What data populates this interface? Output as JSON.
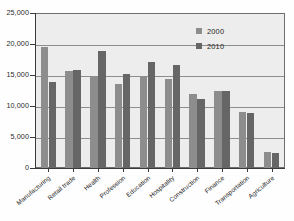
{
  "chart_data": {
    "type": "bar",
    "title": "",
    "xlabel": "",
    "ylabel": "",
    "ylim": [
      0,
      25000
    ],
    "ytick_values": [
      0,
      5000,
      10000,
      15000,
      20000,
      25000
    ],
    "ytick_labels": [
      "0",
      "5,000",
      "10,000",
      "15,000",
      "20,000",
      "25,000"
    ],
    "grid": true,
    "legend_position": "top-right",
    "categories": [
      "Manufacturing",
      "Retail trade",
      "Health",
      "Profession",
      "Education",
      "Hospitality",
      "Construction",
      "Finance",
      "Transportation",
      "Agriculture"
    ],
    "series": [
      {
        "name": "2000",
        "color": "#8d8d8d",
        "values": [
          19600,
          15600,
          14800,
          13600,
          14700,
          14300,
          11900,
          12400,
          9100,
          2600
        ]
      },
      {
        "name": "2010",
        "color": "#666666",
        "values": [
          13900,
          15800,
          18800,
          15200,
          17100,
          16600,
          11200,
          12400,
          8900,
          2400
        ]
      }
    ]
  },
  "legend": {
    "items": [
      {
        "label": "2000",
        "color": "#8d8d8d"
      },
      {
        "label": "2010",
        "color": "#666666"
      }
    ]
  }
}
